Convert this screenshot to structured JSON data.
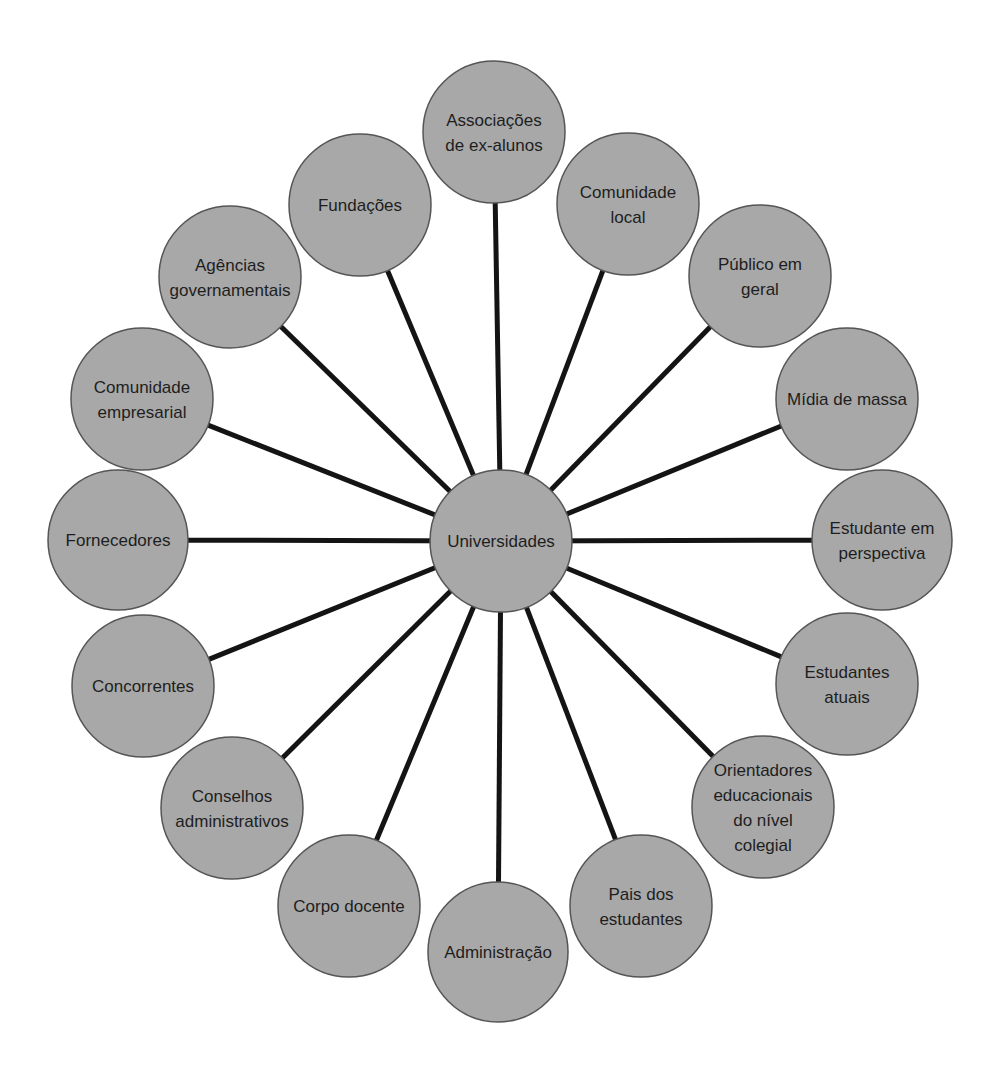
{
  "diagram": {
    "type": "hub-and-spoke",
    "colors": {
      "background": "#ffffff",
      "node_fill": "#a8a8a8",
      "node_stroke": "#555555",
      "spoke": "#141414",
      "text": "#1e1e1e"
    },
    "center": {
      "label": "Universidades",
      "lines": [
        "Universidades"
      ],
      "x": 501,
      "y": 541,
      "r": 71
    },
    "nodes": [
      {
        "id": "associacoes-ex-alunos",
        "lines": [
          "Associações",
          "de ex-alunos"
        ],
        "x": 494,
        "y": 132,
        "r": 71
      },
      {
        "id": "comunidade-local",
        "lines": [
          "Comunidade",
          "local"
        ],
        "x": 628,
        "y": 204,
        "r": 71
      },
      {
        "id": "publico-em-geral",
        "lines": [
          "Público em",
          "geral"
        ],
        "x": 760,
        "y": 276,
        "r": 71
      },
      {
        "id": "midia-de-massa",
        "lines": [
          "Mídia de massa"
        ],
        "x": 847,
        "y": 399,
        "r": 71
      },
      {
        "id": "estudante-em-perspectiva",
        "lines": [
          "Estudante em",
          "perspectiva"
        ],
        "x": 882,
        "y": 540,
        "r": 70
      },
      {
        "id": "estudantes-atuais",
        "lines": [
          "Estudantes",
          "atuais"
        ],
        "x": 847,
        "y": 684,
        "r": 71
      },
      {
        "id": "orientadores-educacionais",
        "lines": [
          "Orientadores",
          "educacionais",
          "do nível",
          "colegial"
        ],
        "x": 763,
        "y": 807,
        "r": 71
      },
      {
        "id": "pais-dos-estudantes",
        "lines": [
          "Pais dos",
          "estudantes"
        ],
        "x": 641,
        "y": 906,
        "r": 71
      },
      {
        "id": "administracao",
        "lines": [
          "Administração"
        ],
        "x": 498,
        "y": 952,
        "r": 70
      },
      {
        "id": "corpo-docente",
        "lines": [
          "Corpo docente"
        ],
        "x": 349,
        "y": 906,
        "r": 71
      },
      {
        "id": "conselhos-administrativos",
        "lines": [
          "Conselhos",
          "administrativos"
        ],
        "x": 232,
        "y": 808,
        "r": 71
      },
      {
        "id": "concorrentes",
        "lines": [
          "Concorrentes"
        ],
        "x": 143,
        "y": 686,
        "r": 71
      },
      {
        "id": "fornecedores",
        "lines": [
          "Fornecedores"
        ],
        "x": 118,
        "y": 540,
        "r": 70
      },
      {
        "id": "comunidade-empresarial",
        "lines": [
          "Comunidade",
          "empresarial"
        ],
        "x": 142,
        "y": 399,
        "r": 71
      },
      {
        "id": "agencias-governamentais",
        "lines": [
          "Agências",
          "governamentais"
        ],
        "x": 230,
        "y": 277,
        "r": 71
      },
      {
        "id": "fundacoes",
        "lines": [
          "Fundações"
        ],
        "x": 360,
        "y": 205,
        "r": 71
      }
    ]
  }
}
